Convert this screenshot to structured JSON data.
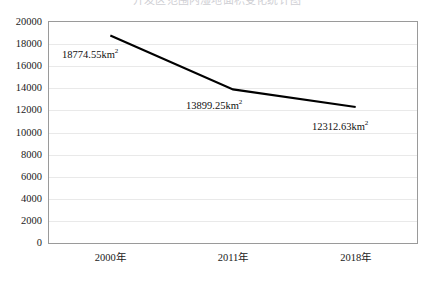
{
  "chart_data": {
    "type": "line",
    "title": "开发区范围内湿地面积变化统计图",
    "title_clipped": true,
    "categories": [
      "2000年",
      "2011年",
      "2018年"
    ],
    "values": [
      18774.55,
      13899.25,
      12312.63
    ],
    "point_labels": [
      "18774.55km²",
      "13899.25km²",
      "12312.63km²"
    ],
    "unit": "km²",
    "xlabel": "",
    "ylabel": "",
    "ylim": [
      0,
      20000
    ],
    "ytick_step": 2000,
    "yticks": [
      "20000",
      "18000",
      "16000",
      "14000",
      "12000",
      "10000",
      "8000",
      "6000",
      "4000",
      "2000",
      "0"
    ],
    "grid": true,
    "legend": false,
    "series_color": "#000000",
    "grid_color": "#e9e9e9",
    "border_color": "#9a9a9a"
  }
}
